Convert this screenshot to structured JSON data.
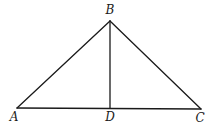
{
  "figure": {
    "type": "geometry",
    "points": {
      "A": {
        "label": "A",
        "x": 17,
        "y": 108,
        "lx": 14,
        "ly": 121
      },
      "B": {
        "label": "B",
        "x": 110,
        "y": 21,
        "lx": 110,
        "ly": 14
      },
      "C": {
        "label": "C",
        "x": 201,
        "y": 109,
        "lx": 200,
        "ly": 122
      },
      "D": {
        "label": "D",
        "x": 110,
        "y": 108,
        "lx": 110,
        "ly": 121
      }
    },
    "segments": [
      {
        "name": "segment-ab",
        "from": "A",
        "to": "B"
      },
      {
        "name": "segment-bc",
        "from": "B",
        "to": "C"
      },
      {
        "name": "segment-ac",
        "from": "A",
        "to": "C"
      },
      {
        "name": "segment-bd",
        "from": "B",
        "to": "D"
      }
    ],
    "colors": {
      "stroke": "#1a1a1a",
      "background": "#ffffff"
    }
  }
}
